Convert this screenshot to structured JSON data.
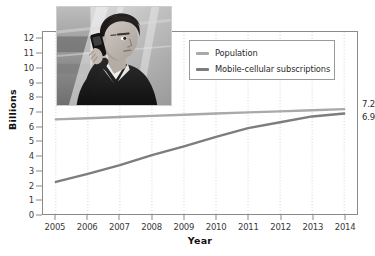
{
  "chart_data": {
    "type": "line",
    "title": "",
    "xlabel": "Year",
    "ylabel": "Billions",
    "x": [
      2005,
      2006,
      2007,
      2008,
      2009,
      2010,
      2011,
      2012,
      2013,
      2014
    ],
    "xtick_labels": [
      "2005",
      "2006",
      "2007",
      "2008",
      "2009",
      "2010",
      "2011",
      "2012",
      "2013",
      "2014"
    ],
    "ytick_labels": [
      "0",
      "1",
      "2",
      "3",
      "4",
      "5",
      "6",
      "7",
      "8",
      "9",
      "10",
      "11",
      "12"
    ],
    "ylim": [
      0,
      12.5
    ],
    "xlim": [
      2004.6,
      2014.4
    ],
    "grid": "vertical-dotted",
    "legend_position": "top-right-inside",
    "series": [
      {
        "name": "Population",
        "color": "#a9a9a9",
        "values": [
          6.5,
          6.58,
          6.66,
          6.74,
          6.82,
          6.9,
          6.98,
          7.05,
          7.13,
          7.2
        ],
        "end_label": "7.2"
      },
      {
        "name": "Mobile-cellular subscriptions",
        "color": "#7d7d7d",
        "values": [
          2.2,
          2.75,
          3.35,
          4.05,
          4.65,
          5.3,
          5.9,
          6.3,
          6.7,
          6.9
        ],
        "end_label": "6.9"
      }
    ],
    "annotations": [
      {
        "text": "7.2",
        "series": "Population",
        "x": 2014,
        "y": 7.2
      },
      {
        "text": "6.9",
        "series": "Mobile-cellular subscriptions",
        "x": 2014,
        "y": 6.9
      }
    ]
  },
  "legend": {
    "items": [
      {
        "label": "Population",
        "color": "#a9a9a9"
      },
      {
        "label": "Mobile-cellular subscriptions",
        "color": "#7d7d7d"
      }
    ]
  },
  "inset": {
    "name": "man-using-mobile-phone-photo",
    "description": "Grayscale photo of a man holding a mobile phone to his ear"
  },
  "colors": {
    "axis": "#8a8a8a",
    "grid": "#d2d2d2",
    "text": "#2b2b2b",
    "population": "#a9a9a9",
    "mobile": "#7d7d7d"
  }
}
